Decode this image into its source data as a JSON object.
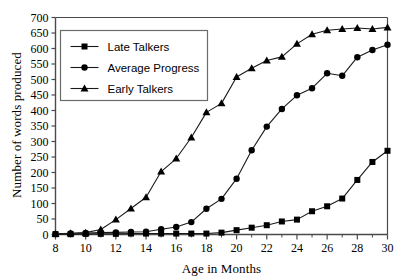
{
  "chart_data": {
    "type": "line",
    "title": "",
    "xlabel": "Age in Months",
    "ylabel": "Number of words produced",
    "xlim": [
      8,
      30
    ],
    "ylim": [
      0,
      700
    ],
    "xticks": [
      8,
      10,
      12,
      14,
      16,
      18,
      20,
      22,
      24,
      26,
      28,
      30
    ],
    "xticklabels": [
      "8",
      "10",
      "12",
      "14",
      "16",
      "18",
      "20",
      "22",
      "24",
      "26",
      "28",
      "30"
    ],
    "xminorticks": [
      9,
      11,
      13,
      15,
      17,
      19,
      21,
      23,
      25,
      27,
      29
    ],
    "yticks": [
      0,
      50,
      100,
      150,
      200,
      250,
      300,
      350,
      400,
      450,
      500,
      550,
      600,
      650,
      700
    ],
    "yticklabels": [
      "0",
      "50",
      "100",
      "150",
      "200",
      "250",
      "300",
      "350",
      "400",
      "450",
      "500",
      "550",
      "600",
      "650",
      "700"
    ],
    "grid": false,
    "legend_position": "upper left",
    "x": [
      8,
      9,
      10,
      11,
      12,
      13,
      14,
      15,
      16,
      17,
      18,
      19,
      20,
      21,
      22,
      23,
      24,
      25,
      26,
      27,
      28,
      29,
      30
    ],
    "series": [
      {
        "name": "Late Talkers",
        "marker": "square",
        "color": "#000000",
        "values": [
          1,
          1,
          2,
          2,
          2,
          3,
          3,
          3,
          3,
          3,
          3,
          6,
          14,
          22,
          30,
          42,
          48,
          75,
          91,
          116,
          176,
          234,
          270
        ]
      },
      {
        "name": "Average Progress",
        "marker": "circle",
        "color": "#000000",
        "values": [
          2,
          3,
          5,
          6,
          7,
          8,
          9,
          17,
          24,
          40,
          83,
          115,
          180,
          272,
          348,
          405,
          449,
          472,
          520,
          512,
          572,
          595,
          612
        ]
      },
      {
        "name": "Early Talkers",
        "marker": "triangle",
        "color": "#000000",
        "values": [
          2,
          4,
          6,
          16,
          48,
          84,
          120,
          203,
          245,
          313,
          394,
          423,
          508,
          536,
          561,
          573,
          615,
          646,
          659,
          663,
          666,
          663,
          668
        ]
      }
    ]
  },
  "legend": {
    "items": [
      {
        "label": "Late Talkers",
        "marker": "square"
      },
      {
        "label": "Average Progress",
        "marker": "circle"
      },
      {
        "label": "Early Talkers",
        "marker": "triangle"
      }
    ]
  },
  "colors": {
    "axis": "#4a4a4a",
    "line": "#1a1a1a",
    "marker": "#000000",
    "legend_border": "#6b6b6b",
    "background": "#ffffff"
  }
}
